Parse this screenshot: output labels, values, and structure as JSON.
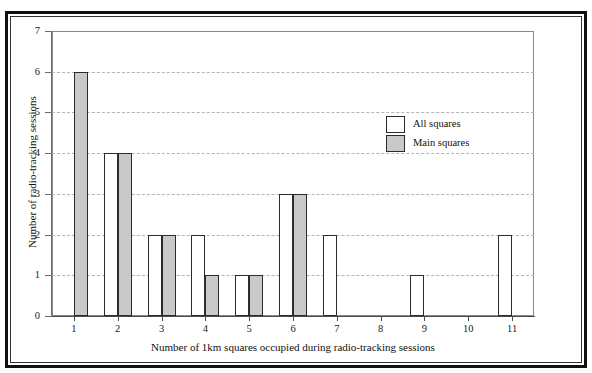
{
  "figure": {
    "background": "#ffffff",
    "frame_color": "#111111",
    "top_artifact": ""
  },
  "chart_data": {
    "type": "bar",
    "title": "",
    "xlabel": "Number of 1km squares occupied during radio-tracking sessions",
    "ylabel": "Number of radio-tracking sessions",
    "categories": [
      "1",
      "2",
      "3",
      "4",
      "5",
      "6",
      "7",
      "8",
      "9",
      "10",
      "11"
    ],
    "yticks": [
      "0",
      "1",
      "2",
      "3",
      "4",
      "5",
      "6",
      "7"
    ],
    "ylim": [
      0,
      7
    ],
    "grid": "horizontal-dashed",
    "legend_position": "upper-right-inside",
    "series": [
      {
        "name": "All squares",
        "color": "#ffffff",
        "edge_color": "#2b2b2b",
        "values": [
          0,
          4,
          2,
          2,
          1,
          3,
          2,
          0,
          1,
          0,
          2
        ]
      },
      {
        "name": "Main squares",
        "color": "#c9c9c9",
        "edge_color": "#2b2b2b",
        "values": [
          6,
          4,
          2,
          1,
          1,
          3,
          0,
          0,
          0,
          0,
          0
        ]
      }
    ]
  }
}
